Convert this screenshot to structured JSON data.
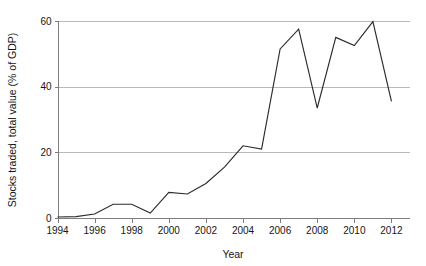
{
  "chart_data": {
    "type": "line",
    "title": "",
    "xlabel": "Year",
    "ylabel": "Stocks traded, total value (% of GDP)",
    "x": [
      1994,
      1995,
      1996,
      1997,
      1998,
      1999,
      2000,
      2001,
      2002,
      2003,
      2004,
      2005,
      2006,
      2007,
      2008,
      2009,
      2010,
      2011,
      2012
    ],
    "values": [
      0.3,
      0.4,
      1.2,
      4.2,
      4.2,
      1.5,
      7.8,
      7.3,
      10.5,
      15.5,
      22.0,
      21.0,
      51.5,
      57.5,
      33.5,
      55.0,
      52.5,
      59.8,
      35.5
    ],
    "series": [
      {
        "name": "Stocks traded, total value (% of GDP)",
        "values": [
          0.3,
          0.4,
          1.2,
          4.2,
          4.2,
          1.5,
          7.8,
          7.3,
          10.5,
          15.5,
          22.0,
          21.0,
          51.5,
          57.5,
          33.5,
          55.0,
          52.5,
          59.8,
          35.5
        ]
      }
    ],
    "xlim": [
      1994,
      2013
    ],
    "ylim": [
      0,
      60
    ],
    "xticks": [
      1994,
      1996,
      1998,
      2000,
      2002,
      2004,
      2006,
      2008,
      2010,
      2012
    ],
    "xtick_labels": [
      "1994",
      "1996",
      "1998",
      "2000",
      "2002",
      "2004",
      "2006",
      "2008",
      "2010",
      "2012"
    ],
    "yticks": [
      0,
      20,
      40,
      60
    ],
    "ytick_labels": [
      "0",
      "20",
      "40",
      "60"
    ],
    "grid": "horizontal",
    "gridlines_at": [
      20,
      40,
      60
    ],
    "legend": "none",
    "line_color": "#2b2b2b",
    "grid_color": "#b9b9b9",
    "axis_color": "#7d7d7d",
    "background": "#ffffff"
  },
  "labels": {
    "y_axis_title": "Stocks traded, total value (% of GDP)",
    "x_axis_title": "Year"
  }
}
